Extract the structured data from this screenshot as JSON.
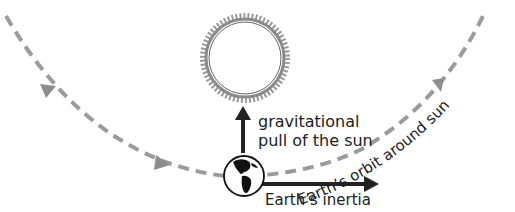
{
  "diagram": {
    "sun": {
      "label": "sun",
      "fill": "#ffffff",
      "corona_color": "#9a9a9a"
    },
    "earth": {
      "label": "earth"
    },
    "labels": {
      "gravity_line1": "gravitational",
      "gravity_line2": "pull of the sun",
      "inertia": "Earth’s inertia",
      "orbit": "Earth’s orbit around sun"
    },
    "colors": {
      "orbit": "#9b9b9b",
      "arrows": "#222222",
      "text": "#222222"
    }
  }
}
